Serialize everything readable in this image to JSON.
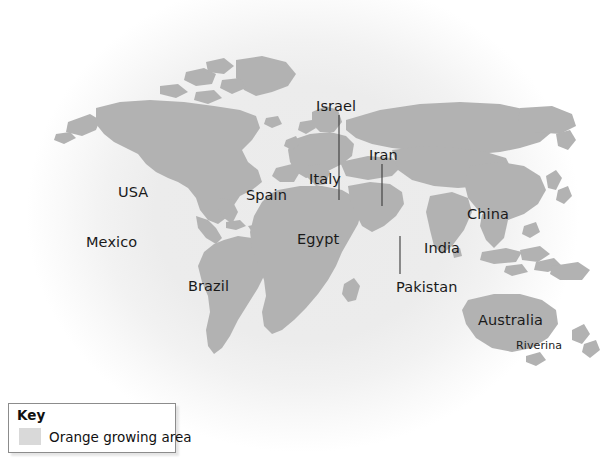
{
  "figure": {
    "type": "thematic-world-map",
    "background_color": "#ffffff",
    "land_color": "#b2b2b2",
    "highlight_color": "#d9d9d9",
    "label_color": "#1a1a1a"
  },
  "key": {
    "title": "Key",
    "swatch_color": "#d9d9d9",
    "entry_label": "Orange growing area"
  },
  "labels": [
    {
      "name": "usa",
      "text": "USA",
      "x": 118,
      "y": 185,
      "size": "normal",
      "leader": null
    },
    {
      "name": "mexico",
      "text": "Mexico",
      "x": 86,
      "y": 235,
      "size": "normal",
      "leader": null
    },
    {
      "name": "brazil",
      "text": "Brazil",
      "x": 188,
      "y": 279,
      "size": "normal",
      "leader": null
    },
    {
      "name": "spain",
      "text": "Spain",
      "x": 246,
      "y": 188,
      "size": "normal",
      "leader": null
    },
    {
      "name": "italy",
      "text": "Italy",
      "x": 309,
      "y": 172,
      "size": "normal",
      "leader": null
    },
    {
      "name": "israel",
      "text": "Israel",
      "x": 316,
      "y": 99,
      "size": "normal",
      "leader": {
        "x1": 339,
        "y1": 115,
        "x2": 339,
        "y2": 200
      }
    },
    {
      "name": "iran",
      "text": "Iran",
      "x": 369,
      "y": 148,
      "size": "normal",
      "leader": {
        "x1": 382,
        "y1": 164,
        "x2": 382,
        "y2": 206
      }
    },
    {
      "name": "egypt",
      "text": "Egypt",
      "x": 297,
      "y": 232,
      "size": "normal",
      "leader": null
    },
    {
      "name": "pakistan",
      "text": "Pakistan",
      "x": 396,
      "y": 280,
      "size": "normal",
      "leader": {
        "x1": 400,
        "y1": 236,
        "x2": 400,
        "y2": 274
      }
    },
    {
      "name": "india",
      "text": "India",
      "x": 424,
      "y": 241,
      "size": "normal",
      "leader": null
    },
    {
      "name": "china",
      "text": "China",
      "x": 467,
      "y": 207,
      "size": "normal",
      "leader": null
    },
    {
      "name": "australia",
      "text": "Australia",
      "x": 478,
      "y": 313,
      "size": "normal",
      "leader": null
    },
    {
      "name": "riverina",
      "text": "Riverina",
      "x": 516,
      "y": 340,
      "size": "small",
      "leader": null
    }
  ]
}
